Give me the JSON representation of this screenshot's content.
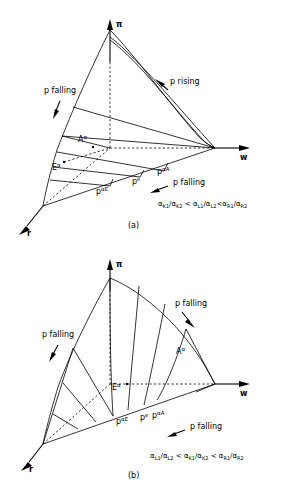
{
  "figure": {
    "panels": [
      {
        "id": "panel-a",
        "caption": "(a)",
        "axes": {
          "vertical": "π",
          "horizontal": "w",
          "depth": "r"
        },
        "annotations": [
          {
            "name": "p-falling-left",
            "text": "p falling"
          },
          {
            "name": "p-rising-right",
            "text": "p rising"
          },
          {
            "name": "p-falling-bottom",
            "text": "p falling"
          }
        ],
        "point_labels": [
          {
            "name": "label-A-alpha",
            "base": "A",
            "sup": "α"
          },
          {
            "name": "label-E-alpha",
            "base": "E",
            "sup": "α"
          },
          {
            "name": "label-p-alpha-E",
            "base": "p",
            "sup": "αE"
          },
          {
            "name": "label-p-e",
            "base": "p",
            "sup": "e"
          },
          {
            "name": "label-p-alpha-A",
            "base": "p",
            "sup": "αA"
          }
        ],
        "inequality": {
          "terms": [
            {
              "num_base": "α",
              "num_sub": "K1",
              "den_base": "α",
              "den_sub": "K2"
            },
            {
              "num_base": "α",
              "num_sub": "L1",
              "den_base": "α",
              "den_sub": "L2"
            },
            {
              "num_base": "α",
              "num_sub": "R1",
              "den_base": "α",
              "den_sub": "R2"
            }
          ],
          "operators": [
            "<",
            "<"
          ],
          "plain": "αK1/αK2 < αL1/αL2 < αR1/αR2"
        }
      },
      {
        "id": "panel-b",
        "caption": "(b)",
        "axes": {
          "vertical": "π",
          "horizontal": "w",
          "depth": "r"
        },
        "annotations": [
          {
            "name": "p-falling-left",
            "text": "p falling"
          },
          {
            "name": "p-falling-right",
            "text": "p falling"
          },
          {
            "name": "p-falling-bottom",
            "text": "p falling"
          }
        ],
        "point_labels": [
          {
            "name": "label-A-alpha",
            "base": "A",
            "sup": "α"
          },
          {
            "name": "label-E-alpha",
            "base": "E",
            "sup": "α"
          },
          {
            "name": "label-p-alpha-E",
            "base": "p",
            "sup": "αE"
          },
          {
            "name": "label-p-e",
            "base": "p",
            "sup": "e"
          },
          {
            "name": "label-p-alpha-A",
            "base": "p",
            "sup": "αA"
          }
        ],
        "inequality": {
          "terms": [
            {
              "num_base": "α",
              "num_sub": "L1",
              "den_base": "α",
              "den_sub": "L2"
            },
            {
              "num_base": "α",
              "num_sub": "K1",
              "den_base": "α",
              "den_sub": "K2"
            },
            {
              "num_base": "α",
              "num_sub": "R1",
              "den_base": "α",
              "den_sub": "R2"
            }
          ],
          "operators": [
            "<",
            "<"
          ],
          "plain": "αL1/αL2 < αK1/αK2 < αR1/αR2"
        }
      }
    ]
  }
}
